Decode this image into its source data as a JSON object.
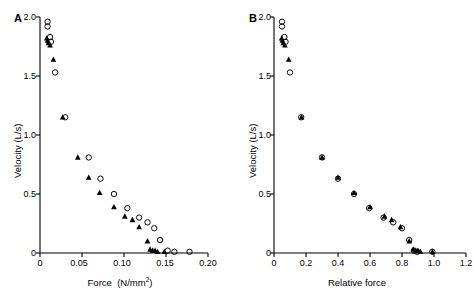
{
  "figure": {
    "background": "#ffffff",
    "axis_color": "#000000",
    "marker_fill_color": "#000000",
    "marker_open_color": "#000000"
  },
  "panels": [
    {
      "letter": "A",
      "xlabel_main": "Force",
      "xlabel_units": "(N/mm",
      "xlabel_exponent": "2",
      "xlabel_units_close": ")",
      "ylabel": "Velocity  (L/s)",
      "xticks": [
        "0",
        "0.05",
        "0.10",
        "0.15",
        "0.20"
      ],
      "yticks": [
        "0",
        "0.5",
        "1.0",
        "1.5",
        "2.0"
      ]
    },
    {
      "letter": "B",
      "xlabel_main": "Relative force",
      "xlabel_units": "",
      "xlabel_exponent": "",
      "xlabel_units_close": "",
      "ylabel": "Velocity  (L/s)",
      "xticks": [
        "0",
        "0.2",
        "0.4",
        "0.6",
        "0.8",
        "1.0",
        "1.2"
      ],
      "yticks": [
        "0",
        "0.5",
        "1.0",
        "1.5",
        "2.0"
      ]
    }
  ],
  "chart_data": [
    {
      "type": "scatter",
      "panel": "A",
      "title": "",
      "xlabel": "Force (N/mm2)",
      "ylabel": "Velocity (L/s)",
      "xlim": [
        0,
        0.2
      ],
      "ylim": [
        0,
        2.0
      ],
      "xticks": [
        0,
        0.05,
        0.1,
        0.15,
        0.2
      ],
      "yticks": [
        0,
        0.5,
        1.0,
        1.5,
        2.0
      ],
      "grid": false,
      "legend": "none",
      "series": [
        {
          "name": "open-circle",
          "marker": "open_circle",
          "x": [
            0.009,
            0.009,
            0.012,
            0.013,
            0.018,
            0.03,
            0.058,
            0.072,
            0.088,
            0.104,
            0.118,
            0.128,
            0.136,
            0.143,
            0.152,
            0.16,
            0.178
          ],
          "y": [
            1.96,
            1.92,
            1.83,
            1.79,
            1.53,
            1.15,
            0.81,
            0.63,
            0.5,
            0.38,
            0.3,
            0.26,
            0.21,
            0.11,
            0.02,
            0.01,
            0.01
          ]
        },
        {
          "name": "filled-triangle",
          "marker": "filled_triangle",
          "x": [
            0.008,
            0.009,
            0.01,
            0.012,
            0.016,
            0.027,
            0.045,
            0.058,
            0.071,
            0.088,
            0.101,
            0.11,
            0.118,
            0.128,
            0.131,
            0.134,
            0.137,
            0.14,
            0.148
          ],
          "y": [
            1.82,
            1.8,
            1.78,
            1.76,
            1.64,
            1.15,
            0.81,
            0.64,
            0.51,
            0.39,
            0.31,
            0.28,
            0.22,
            0.1,
            0.03,
            0.02,
            0.02,
            0.01,
            0.01
          ]
        }
      ]
    },
    {
      "type": "scatter",
      "panel": "B",
      "title": "",
      "xlabel": "Relative force",
      "ylabel": "Velocity (L/s)",
      "xlim": [
        0,
        1.2
      ],
      "ylim": [
        0,
        2.0
      ],
      "xticks": [
        0,
        0.2,
        0.4,
        0.6,
        0.8,
        1.0,
        1.2
      ],
      "yticks": [
        0,
        0.5,
        1.0,
        1.5,
        2.0
      ],
      "grid": false,
      "legend": "none",
      "series": [
        {
          "name": "open-circle",
          "marker": "open_circle",
          "x": [
            0.05,
            0.05,
            0.065,
            0.072,
            0.1,
            0.17,
            0.3,
            0.4,
            0.5,
            0.595,
            0.685,
            0.745,
            0.8,
            0.845,
            0.875,
            0.895,
            0.99
          ],
          "y": [
            1.96,
            1.92,
            1.83,
            1.79,
            1.53,
            1.15,
            0.81,
            0.63,
            0.5,
            0.38,
            0.3,
            0.26,
            0.21,
            0.11,
            0.02,
            0.01,
            0.01
          ]
        },
        {
          "name": "filled-triangle",
          "marker": "filled_triangle",
          "x": [
            0.048,
            0.052,
            0.058,
            0.068,
            0.092,
            0.172,
            0.3,
            0.4,
            0.5,
            0.6,
            0.69,
            0.735,
            0.79,
            0.845,
            0.87,
            0.885,
            0.9,
            0.915,
            0.99
          ],
          "y": [
            1.82,
            1.8,
            1.78,
            1.76,
            1.64,
            1.15,
            0.81,
            0.64,
            0.51,
            0.39,
            0.31,
            0.28,
            0.22,
            0.1,
            0.03,
            0.02,
            0.02,
            0.01,
            0.01
          ]
        }
      ]
    }
  ]
}
